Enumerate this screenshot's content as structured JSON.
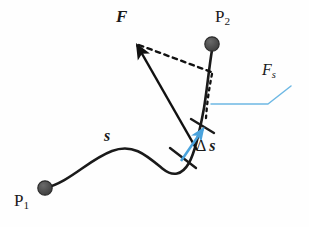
{
  "figure": {
    "width": 309,
    "height": 227,
    "background_color": "#fefefe"
  },
  "colors": {
    "curve": "#1a1a1a",
    "force_arrow": "#111111",
    "dashed_component": "#111111",
    "delta_s_arrow": "#4aa3dd",
    "leader_line": "#6db8e4",
    "point_marker_fill": "#4f4f4f",
    "point_marker_stroke": "#2b2b2b",
    "text": "#1a1a1a"
  },
  "labels": {
    "force": "F",
    "point_2": "P",
    "point_2_sub": "2",
    "tangential_force": "F",
    "tangential_force_sub": "s",
    "delta_s_symbol": "Δ",
    "delta_s_var": "s",
    "arc_length": "s",
    "point_1": "P",
    "point_1_sub": "1"
  },
  "geometry": {
    "path_start": [
      45,
      188
    ],
    "path_end": [
      212,
      48
    ],
    "force_arrow_tail": [
      197,
      149
    ],
    "force_arrow_head": [
      133,
      41
    ],
    "dashed_from": [
      135,
      43
    ],
    "dashed_to": [
      215,
      72
    ],
    "delta_s_arrow_tail": [
      183,
      159
    ],
    "delta_s_arrow_head": [
      205,
      128
    ],
    "leader_elbow": [
      268,
      104
    ],
    "leader_end": [
      291,
      86
    ],
    "tick_lower": [
      183,
      158
    ],
    "tick_upper": [
      204,
      127
    ],
    "marker_radius": 7
  }
}
